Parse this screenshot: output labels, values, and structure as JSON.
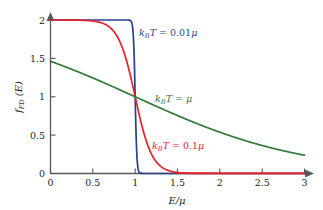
{
  "figure": {
    "background": "#ffffff",
    "axis_color": "#58595b"
  },
  "chart_data": {
    "type": "line",
    "title": "",
    "subtitle": "",
    "xlabel": "E/μ",
    "ylabel": "f_FD (E)",
    "xlim": [
      0,
      3
    ],
    "ylim": [
      0,
      2
    ],
    "xticks": [
      0,
      0.5,
      1,
      1.5,
      2,
      2.5,
      3
    ],
    "xtick_labels": [
      "0",
      "0.5",
      "1",
      "1.5",
      "2",
      "2.5",
      "3"
    ],
    "yticks": [
      0,
      0.5,
      1,
      1.5,
      2
    ],
    "ytick_labels": [
      "0",
      "0.5",
      "1",
      "1.5",
      "2"
    ],
    "grid": false,
    "legend_position": "inline-annotations",
    "formula": "f_FD(E) = 2 / (exp((E-μ)/kBT) + 1)",
    "crossing_point": {
      "x": 1,
      "y": 1
    },
    "series": [
      {
        "name": "kBT = 0.01μ",
        "color": "#2b3f8c",
        "kT": 0.01,
        "amplitude": 2,
        "x": [
          0,
          0.1,
          0.2,
          0.3,
          0.4,
          0.5,
          0.6,
          0.7,
          0.8,
          0.9,
          0.95,
          0.97,
          0.98,
          0.99,
          1.0,
          1.01,
          1.02,
          1.03,
          1.05,
          1.1,
          1.2,
          1.4,
          1.6,
          2.0,
          2.5,
          3.0
        ],
        "y": [
          2,
          2,
          2,
          2,
          2,
          2,
          2,
          2,
          2,
          2,
          2,
          1.997,
          1.976,
          1.881,
          1.0,
          0.119,
          0.024,
          0.003,
          0.0,
          0.0,
          0.0,
          0.0,
          0.0,
          0.0,
          0.0,
          0.0
        ]
      },
      {
        "name": "kBT = 0.1μ",
        "color": "#e8202a",
        "kT": 0.1,
        "amplitude": 2,
        "x": [
          0,
          0.2,
          0.4,
          0.5,
          0.6,
          0.7,
          0.8,
          0.85,
          0.9,
          0.95,
          1.0,
          1.05,
          1.1,
          1.15,
          1.2,
          1.3,
          1.4,
          1.5,
          1.7,
          2.0,
          2.5,
          3.0
        ],
        "y": [
          2,
          1.999,
          1.982,
          1.962,
          1.924,
          1.852,
          1.716,
          1.61,
          1.462,
          1.245,
          1.0,
          0.755,
          0.538,
          0.363,
          0.238,
          0.095,
          0.036,
          0.013,
          0.002,
          0.0,
          0.0,
          0.0
        ]
      },
      {
        "name": "kBT = μ",
        "color": "#2f7a36",
        "kT": 1.0,
        "amplitude": 2,
        "x": [
          0,
          0.25,
          0.5,
          0.75,
          1.0,
          1.25,
          1.5,
          1.75,
          2.0,
          2.25,
          2.5,
          2.75,
          3.0
        ],
        "y": [
          1.462,
          1.32,
          1.189,
          1.09,
          1.0,
          0.876,
          0.776,
          0.683,
          0.597,
          0.52,
          0.45,
          0.388,
          0.335
        ]
      }
    ],
    "annotations": [
      {
        "text_parts": {
          "k": "k",
          "sub": "B",
          "T": "T",
          "eq": " = 0.01",
          "mu": "μ"
        },
        "label": "kBT = 0.01μ",
        "color": "#2b3f8c",
        "x_px": 139,
        "y_px": 33
      },
      {
        "text_parts": {
          "k": "k",
          "sub": "B",
          "T": "T",
          "eq": " = ",
          "mu": "μ"
        },
        "label": "kBT = μ",
        "color": "#2f7a36",
        "x_px": 155,
        "y_px": 99
      },
      {
        "text_parts": {
          "k": "k",
          "sub": "B",
          "T": "T",
          "eq": " = 0.1",
          "mu": "μ"
        },
        "label": "kBT = 0.1μ",
        "color": "#e8202a",
        "x_px": 152,
        "y_px": 146
      }
    ]
  },
  "labels": {
    "xaxis": "E/μ",
    "yaxis_f": "f",
    "yaxis_sub": "FD",
    "yaxis_tail": " (E)",
    "ann_k": "k",
    "ann_sub_B": "B",
    "ann_T": "T",
    "ann_eq_001": " = 0.01",
    "ann_eq_01": " = 0.1",
    "ann_eq_plain": " = ",
    "ann_mu": "μ"
  }
}
